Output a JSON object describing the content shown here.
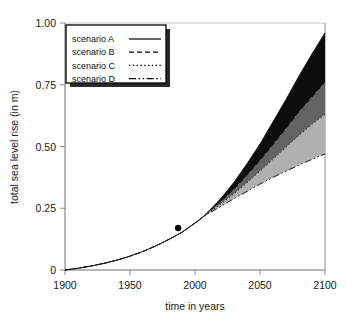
{
  "chart_data": {
    "type": "area",
    "title": "",
    "subtitle": "",
    "xlabel": "time in years",
    "ylabel": "total sea level rise (in m)",
    "xlim": [
      1900,
      2100
    ],
    "ylim": [
      0,
      1.0
    ],
    "xticks": [
      1900,
      1950,
      2000,
      2050,
      2100
    ],
    "xticklabels": [
      "1900",
      "1950",
      "2000",
      "2050",
      "2100"
    ],
    "yticks": [
      0,
      0.25,
      0.5,
      0.75,
      1.0
    ],
    "yticklabels": [
      "0",
      "0.25",
      "0.50",
      "0.75",
      "1.00"
    ],
    "grid": false,
    "legend_position": "upper left",
    "x": [
      1900,
      1910,
      1920,
      1930,
      1940,
      1950,
      1960,
      1970,
      1980,
      1990,
      2000,
      2005,
      2010,
      2020,
      2030,
      2040,
      2050,
      2060,
      2070,
      2080,
      2090,
      2100
    ],
    "series": [
      {
        "name": "scenario A",
        "linestyle": "solid",
        "values": [
          0.0,
          0.007,
          0.016,
          0.027,
          0.04,
          0.056,
          0.075,
          0.098,
          0.124,
          0.153,
          0.19,
          0.21,
          0.235,
          0.29,
          0.355,
          0.43,
          0.51,
          0.6,
          0.69,
          0.785,
          0.875,
          0.96
        ]
      },
      {
        "name": "scenario B",
        "linestyle": "dashed",
        "values": [
          0.0,
          0.007,
          0.016,
          0.027,
          0.04,
          0.056,
          0.075,
          0.098,
          0.124,
          0.153,
          0.19,
          0.21,
          0.232,
          0.277,
          0.327,
          0.383,
          0.443,
          0.507,
          0.572,
          0.64,
          0.7,
          0.76
        ]
      },
      {
        "name": "scenario C",
        "linestyle": "dotted",
        "values": [
          0.0,
          0.007,
          0.016,
          0.027,
          0.04,
          0.056,
          0.075,
          0.098,
          0.124,
          0.153,
          0.19,
          0.21,
          0.23,
          0.268,
          0.309,
          0.353,
          0.4,
          0.448,
          0.497,
          0.545,
          0.59,
          0.63
        ]
      },
      {
        "name": "scenario D",
        "linestyle": "dashdot",
        "values": [
          0.0,
          0.007,
          0.016,
          0.027,
          0.04,
          0.056,
          0.075,
          0.098,
          0.124,
          0.153,
          0.19,
          0.21,
          0.228,
          0.258,
          0.289,
          0.318,
          0.348,
          0.375,
          0.4,
          0.425,
          0.448,
          0.47
        ]
      }
    ],
    "bands": [
      {
        "name": "band-a-b",
        "upper": "scenario A",
        "lower": "scenario B",
        "color": "#0d0d0d"
      },
      {
        "name": "band-b-c",
        "upper": "scenario B",
        "lower": "scenario C",
        "color": "#636363"
      },
      {
        "name": "band-c-d",
        "upper": "scenario C",
        "lower": "scenario D",
        "color": "#b0b0b0"
      }
    ],
    "markers": [
      {
        "name": "observation-point",
        "x": 1987,
        "y": 0.17,
        "color": "#000000"
      }
    ],
    "annotations": []
  },
  "legend": {
    "entries": [
      {
        "label": "scenario A",
        "style": "solid"
      },
      {
        "label": "scenario B",
        "style": "dashed"
      },
      {
        "label": "scenario C",
        "style": "dotted"
      },
      {
        "label": "scenario D",
        "style": "dashdot"
      }
    ]
  },
  "colors": {
    "band_a_b": "#0d0d0d",
    "band_b_c": "#636363",
    "band_c_d": "#b0b0b0",
    "line": "#1a1a1a",
    "axis": "#8a8a8a",
    "text": "#1a1a1a",
    "legend_shadow": "#2b2b2b"
  }
}
